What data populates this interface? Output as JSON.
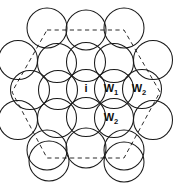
{
  "figure": {
    "background_color": "#ffffff",
    "circle_stroke_color": "#1a1a1a",
    "dashed_ring_color": "#2b2b2b",
    "label_color": "#111111"
  },
  "geometry": {
    "width": 175,
    "height": 186,
    "circle_radius": 19.5,
    "row_spacing": 28.5,
    "column_spacing": 28.0
  },
  "circles": [
    {
      "id": "r1c1",
      "cx": 47,
      "cy": 28,
      "r": 20.0,
      "label": "",
      "sub": "",
      "row": 1
    },
    {
      "id": "r1c2",
      "cx": 86,
      "cy": 30,
      "r": 20.0,
      "label": "",
      "sub": "",
      "row": 1
    },
    {
      "id": "r1c3",
      "cx": 124,
      "cy": 28,
      "r": 20.0,
      "label": "",
      "sub": "",
      "row": 1
    },
    {
      "id": "r2c1",
      "cx": 18,
      "cy": 60,
      "r": 19.5,
      "label": "",
      "sub": "",
      "row": 2
    },
    {
      "id": "r2c2",
      "cx": 57,
      "cy": 63,
      "r": 19.5,
      "label": "",
      "sub": "",
      "row": 2
    },
    {
      "id": "r2c3",
      "cx": 86,
      "cy": 62,
      "r": 19.5,
      "label": "",
      "sub": "",
      "row": 2
    },
    {
      "id": "r2c4",
      "cx": 114,
      "cy": 63,
      "r": 19.5,
      "label": "",
      "sub": "",
      "row": 2
    },
    {
      "id": "r2c5",
      "cx": 153,
      "cy": 60,
      "r": 19.5,
      "label": "",
      "sub": "",
      "row": 2
    },
    {
      "id": "r3c1",
      "cx": 30,
      "cy": 90,
      "r": 19.5,
      "label": "",
      "sub": "",
      "row": 3
    },
    {
      "id": "r3c2",
      "cx": 58,
      "cy": 90,
      "r": 19.5,
      "label": "",
      "sub": "",
      "row": 3
    },
    {
      "id": "r3c3",
      "cx": 86,
      "cy": 89,
      "r": 19.5,
      "label": "i",
      "sub": "",
      "row": 3
    },
    {
      "id": "r3c4",
      "cx": 114,
      "cy": 89,
      "r": 19.5,
      "label": "W",
      "sub": "1",
      "row": 3
    },
    {
      "id": "r3c5",
      "cx": 142,
      "cy": 89,
      "r": 19.5,
      "label": "W",
      "sub": "2",
      "row": 3
    },
    {
      "id": "r4c1",
      "cx": 18,
      "cy": 120,
      "r": 19.5,
      "label": "",
      "sub": "",
      "row": 4
    },
    {
      "id": "r4c2",
      "cx": 57,
      "cy": 118,
      "r": 19.5,
      "label": "",
      "sub": "",
      "row": 4
    },
    {
      "id": "r4c3",
      "cx": 86,
      "cy": 117,
      "r": 19.5,
      "label": "",
      "sub": "",
      "row": 4
    },
    {
      "id": "r4c4",
      "cx": 114,
      "cy": 118,
      "r": 19.5,
      "label": "W",
      "sub": "2",
      "row": 4
    },
    {
      "id": "r4c5",
      "cx": 153,
      "cy": 120,
      "r": 19.5,
      "label": "",
      "sub": "",
      "row": 4
    },
    {
      "id": "r5c1",
      "cx": 47,
      "cy": 150,
      "r": 20.0,
      "label": "",
      "sub": "",
      "row": 5
    },
    {
      "id": "r5c2",
      "cx": 86,
      "cy": 148,
      "r": 20.0,
      "label": "",
      "sub": "",
      "row": 5
    },
    {
      "id": "r5c3",
      "cx": 124,
      "cy": 150,
      "r": 20.0,
      "label": "",
      "sub": "",
      "row": 5
    },
    {
      "id": "r6c1",
      "cx": 49,
      "cy": 161,
      "r": 20.0,
      "label": "",
      "sub": "",
      "row": 6
    },
    {
      "id": "r6c2",
      "cx": 124,
      "cy": 162,
      "r": 20.0,
      "label": "",
      "sub": "",
      "row": 6
    }
  ],
  "dashed_ring": {
    "shape": "hexagon",
    "center_x": 86,
    "center_y": 92,
    "radius": 76,
    "points": "47,30 124,30 160,92 124,158 47,158 12,92"
  },
  "labels": [
    {
      "name": "center-ion-label",
      "text": "i",
      "sub": "",
      "x": 86,
      "y": 89
    },
    {
      "name": "water-shell-1-label",
      "text": "W",
      "sub": "1",
      "x": 114,
      "y": 89
    },
    {
      "name": "water-shell-2-label",
      "text": "W",
      "sub": "2",
      "x": 142,
      "y": 89
    },
    {
      "name": "water-shell-2b-label",
      "text": "W",
      "sub": "2",
      "x": 114,
      "y": 118
    }
  ]
}
